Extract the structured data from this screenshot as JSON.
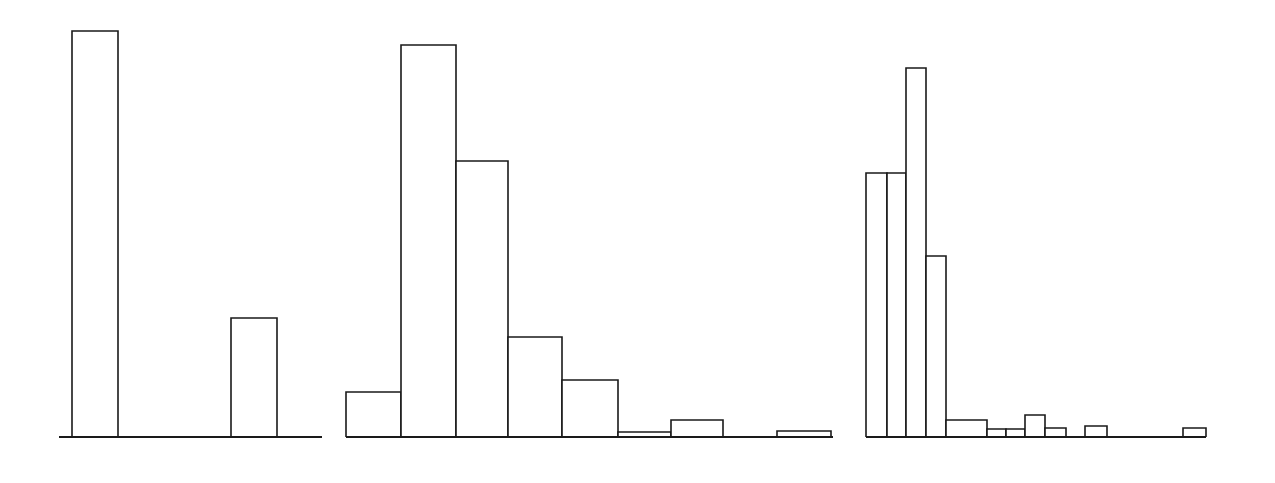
{
  "figure": {
    "title": "",
    "width": 1275,
    "height": 483,
    "background_color": "#ffffff",
    "line_color": "#1a1a1a",
    "bar_fill_color": "#ffffff"
  },
  "chart_data": [
    {
      "type": "bar",
      "panel_index": 0,
      "panel_name": "left-histogram",
      "title": "",
      "subtitle": "",
      "xlabel": "",
      "ylabel": "",
      "grid": false,
      "legend": null,
      "xlim": [
        0,
        12
      ],
      "ylim": [
        0,
        420
      ],
      "axis": {
        "baseline_y": 437,
        "x_start": 59,
        "x_end": 322
      },
      "categories": [
        "1",
        "2",
        "3",
        "4",
        "5",
        "6"
      ],
      "values": [
        406,
        0,
        0,
        0,
        119,
        0
      ],
      "bars": [
        {
          "label": "1",
          "x_left": 72,
          "x_right": 118,
          "value": 406,
          "top_y": 31
        },
        {
          "label": "5",
          "x_left": 231,
          "x_right": 277,
          "value": 119,
          "top_y": 318
        }
      ]
    },
    {
      "type": "bar",
      "panel_index": 1,
      "panel_name": "middle-histogram",
      "title": "",
      "subtitle": "",
      "xlabel": "",
      "ylabel": "",
      "grid": false,
      "legend": null,
      "xlim": [
        0,
        9
      ],
      "ylim": [
        0,
        420
      ],
      "axis": {
        "baseline_y": 437,
        "x_start": 346,
        "x_end": 833
      },
      "categories": [
        "1",
        "2",
        "3",
        "4",
        "5",
        "6",
        "7",
        "8",
        "9"
      ],
      "values": [
        45,
        392,
        276,
        100,
        57,
        5,
        17,
        0,
        6
      ],
      "bars": [
        {
          "label": "1",
          "x_left": 346,
          "x_right": 401,
          "value": 45,
          "top_y": 392
        },
        {
          "label": "2",
          "x_left": 401,
          "x_right": 456,
          "value": 392,
          "top_y": 45
        },
        {
          "label": "3",
          "x_left": 456,
          "x_right": 508,
          "value": 276,
          "top_y": 161
        },
        {
          "label": "4",
          "x_left": 508,
          "x_right": 562,
          "value": 100,
          "top_y": 337
        },
        {
          "label": "5",
          "x_left": 562,
          "x_right": 618,
          "value": 57,
          "top_y": 380
        },
        {
          "label": "6",
          "x_left": 618,
          "x_right": 671,
          "value": 5,
          "top_y": 432
        },
        {
          "label": "7",
          "x_left": 671,
          "x_right": 723,
          "value": 17,
          "top_y": 420
        },
        {
          "label": "8",
          "x_left": 723,
          "x_right": 777,
          "value": 0,
          "top_y": 437
        },
        {
          "label": "9",
          "x_left": 777,
          "x_right": 831,
          "value": 6,
          "top_y": 431
        }
      ]
    },
    {
      "type": "bar",
      "panel_index": 2,
      "panel_name": "right-histogram",
      "title": "",
      "subtitle": "",
      "xlabel": "",
      "ylabel": "",
      "grid": false,
      "legend": null,
      "xlim": [
        0,
        17
      ],
      "ylim": [
        0,
        420
      ],
      "axis": {
        "baseline_y": 437,
        "x_start": 866,
        "x_end": 1206
      },
      "categories": [
        "1",
        "2",
        "3",
        "4",
        "5",
        "6",
        "7",
        "8",
        "9",
        "10",
        "11",
        "12",
        "13",
        "14",
        "15",
        "16",
        "17"
      ],
      "values": [
        264,
        0,
        369,
        181,
        17,
        8,
        8,
        22,
        9,
        0,
        11,
        0,
        0,
        0,
        0,
        0,
        9
      ],
      "bars": [
        {
          "label": "1",
          "x_left": 866,
          "x_right": 887,
          "value": 264,
          "top_y": 173
        },
        {
          "label": "2",
          "x_left": 887,
          "x_right": 906,
          "value": 264,
          "top_y": 173
        },
        {
          "label": "3",
          "x_left": 906,
          "x_right": 926,
          "value": 369,
          "top_y": 68
        },
        {
          "label": "4",
          "x_left": 926,
          "x_right": 946,
          "value": 181,
          "top_y": 256
        },
        {
          "label": "5",
          "x_left": 946,
          "x_right": 987,
          "value": 17,
          "top_y": 420
        },
        {
          "label": "6",
          "x_left": 987,
          "x_right": 1006,
          "value": 8,
          "top_y": 429
        },
        {
          "label": "7",
          "x_left": 1006,
          "x_right": 1025,
          "value": 8,
          "top_y": 429
        },
        {
          "label": "8",
          "x_left": 1025,
          "x_right": 1045,
          "value": 22,
          "top_y": 415
        },
        {
          "label": "9",
          "x_left": 1045,
          "x_right": 1066,
          "value": 9,
          "top_y": 428
        },
        {
          "label": "10",
          "x_left": 1085,
          "x_right": 1107,
          "value": 11,
          "top_y": 426
        },
        {
          "label": "17",
          "x_left": 1183,
          "x_right": 1206,
          "value": 9,
          "top_y": 428
        }
      ]
    }
  ]
}
